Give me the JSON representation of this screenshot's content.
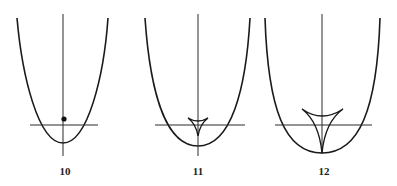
{
  "figures": [
    {
      "label": "10",
      "description": "parabola with vertical axis, horizontal line, and focal point dot",
      "feature": "point"
    },
    {
      "label": "11",
      "description": "parabola with vertical axis, horizontal line, and small three-cusped caustic",
      "feature": "small-deltoid"
    },
    {
      "label": "12",
      "description": "wider parabola with vertical axis, horizontal line, and large three-cusped caustic with cusp at vertex",
      "feature": "large-deltoid"
    }
  ],
  "colors": {
    "stroke": "#1a1a1a",
    "background": "#ffffff"
  }
}
